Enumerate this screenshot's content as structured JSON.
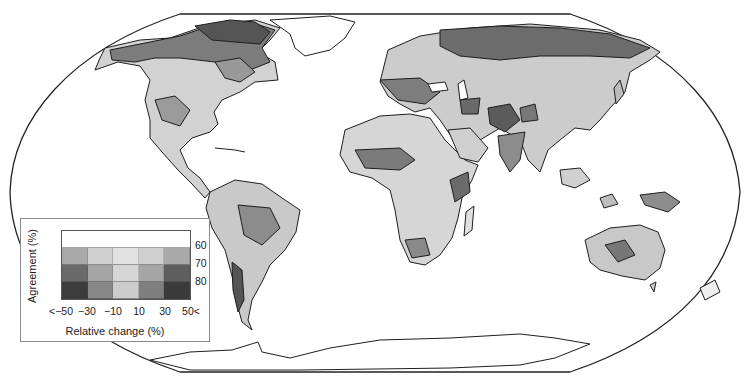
{
  "map": {
    "projection": "Robinson (world)",
    "frame_color": "#222222",
    "shading_scale": [
      "#ffffff",
      "#e6e6e6",
      "#c4c4c4",
      "#9a9a9a",
      "#6e6e6e",
      "#4a4a4a"
    ]
  },
  "legend": {
    "ylabel": "Agreement (%)",
    "xlabel": "Relative change (%)",
    "y_ticks": [
      "60",
      "70",
      "80"
    ],
    "x_ticks": [
      "<−50",
      "−30",
      "−10",
      "10",
      "30",
      "50<"
    ],
    "grid": [
      [
        "#ffffff",
        "#ffffff",
        "#ffffff",
        "#ffffff",
        "#ffffff"
      ],
      [
        "#a9a9a9",
        "#cfcfcf",
        "#e2e2e2",
        "#cfcfcf",
        "#a9a9a9"
      ],
      [
        "#6a6a6a",
        "#a5a5a5",
        "#d6d6d6",
        "#a5a5a5",
        "#5e5e5e"
      ],
      [
        "#3c3c3c",
        "#888888",
        "#cccccc",
        "#7f7f7f",
        "#3a3a3a"
      ]
    ]
  },
  "chart_data": {
    "type": "heatmap",
    "title": "",
    "xlabel": "Relative change (%)",
    "ylabel": "Agreement (%)",
    "x_categories": [
      "<-50",
      "-30",
      "-10",
      "10",
      "30",
      "50<"
    ],
    "y_categories": [
      "60",
      "70",
      "80"
    ],
    "legend_position": "lower-left"
  }
}
